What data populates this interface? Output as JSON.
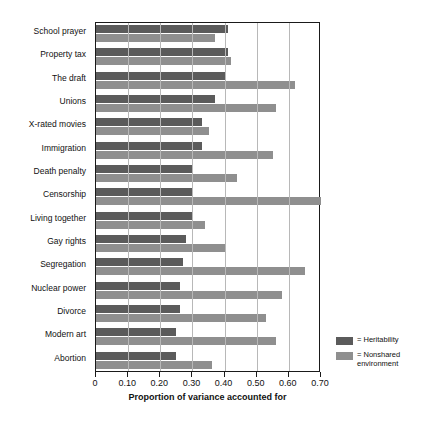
{
  "chart_data": {
    "type": "bar",
    "orientation": "horizontal",
    "title": "",
    "xlabel": "Proportion of variance accounted for",
    "ylabel": "",
    "xlim": [
      0,
      0.7
    ],
    "xticks": [
      0,
      0.1,
      0.2,
      0.3,
      0.4,
      0.5,
      0.6,
      0.7
    ],
    "xtick_labels": [
      "0",
      "0.10",
      "0.20",
      "0.30",
      "0.40",
      "0.50",
      "0.60",
      "0.70"
    ],
    "grid": true,
    "grid_axis": "x",
    "legend_position": "right",
    "categories": [
      "School prayer",
      "Property tax",
      "The draft",
      "Unions",
      "X-rated movies",
      "Immigration",
      "Death penalty",
      "Censorship",
      "Living together",
      "Gay rights",
      "Segregation",
      "Nuclear power",
      "Divorce",
      "Modern art",
      "Abortion"
    ],
    "series": [
      {
        "name": "Heritability",
        "color": "#5b5b5b",
        "values": [
          0.41,
          0.41,
          0.4,
          0.37,
          0.33,
          0.33,
          0.3,
          0.3,
          0.3,
          0.28,
          0.27,
          0.26,
          0.26,
          0.25,
          0.25
        ]
      },
      {
        "name": "Nonshared environment",
        "color": "#8f8f8f",
        "values": [
          0.37,
          0.42,
          0.62,
          0.56,
          0.35,
          0.55,
          0.44,
          0.7,
          0.34,
          0.4,
          0.65,
          0.58,
          0.53,
          0.56,
          0.36
        ]
      }
    ]
  },
  "legend": {
    "items": [
      {
        "equals": "=",
        "label": "Heritability"
      },
      {
        "equals": "=",
        "label": "Nonshared environment"
      }
    ]
  }
}
